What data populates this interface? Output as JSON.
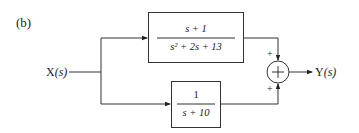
{
  "figure_label": "(b)",
  "input": {
    "label": "X",
    "arg": "(s)"
  },
  "output": {
    "label": "Y",
    "arg": "(s)"
  },
  "blocks": [
    {
      "id": "top",
      "numerator": "s + 1",
      "denominator": "s² + 2s + 13"
    },
    {
      "id": "bottom",
      "numerator": "1",
      "denominator": "s + 10"
    }
  ],
  "summing_junction": {
    "symbol": "+",
    "top_sign": "+",
    "bottom_sign": "+"
  },
  "colors": {
    "line": "#222222",
    "background": "#ffffff"
  }
}
